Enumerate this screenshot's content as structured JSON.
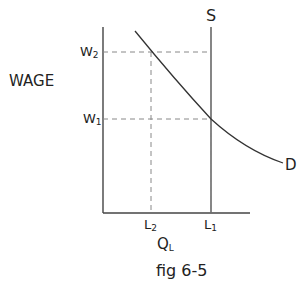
{
  "diagram": {
    "y_axis_label": "WAGE",
    "x_axis_label": "Q",
    "x_axis_label_sub": "L",
    "caption": "fig 6-5",
    "supply_label": "S",
    "demand_label": "D",
    "y_ticks": [
      {
        "label": "W",
        "sub": "2"
      },
      {
        "label": "W",
        "sub": "1"
      }
    ],
    "x_ticks": [
      {
        "label": "L",
        "sub": "2"
      },
      {
        "label": "L",
        "sub": "1"
      }
    ]
  },
  "colors": {
    "axis": "#444444",
    "dashed": "#888888",
    "curve": "#333333",
    "text": "#222222"
  }
}
